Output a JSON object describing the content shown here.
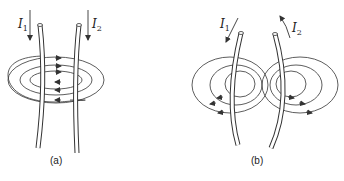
{
  "figure": {
    "panel_a": {
      "caption": "(a)",
      "current_1": {
        "symbol": "I",
        "subscript": "1",
        "direction": "down"
      },
      "current_2": {
        "symbol": "I",
        "subscript": "2",
        "direction": "down"
      },
      "description": "Two parallel wires carrying currents in the same direction; field lines encircle both wires"
    },
    "panel_b": {
      "caption": "(b)",
      "current_1": {
        "symbol": "I",
        "subscript": "1",
        "direction": "down"
      },
      "current_2": {
        "symbol": "I",
        "subscript": "2",
        "direction": "up"
      },
      "description": "Two wires carrying currents in opposite directions; separate field loops around each wire"
    },
    "colors": {
      "line": "#333333",
      "background": "#ffffff"
    }
  }
}
